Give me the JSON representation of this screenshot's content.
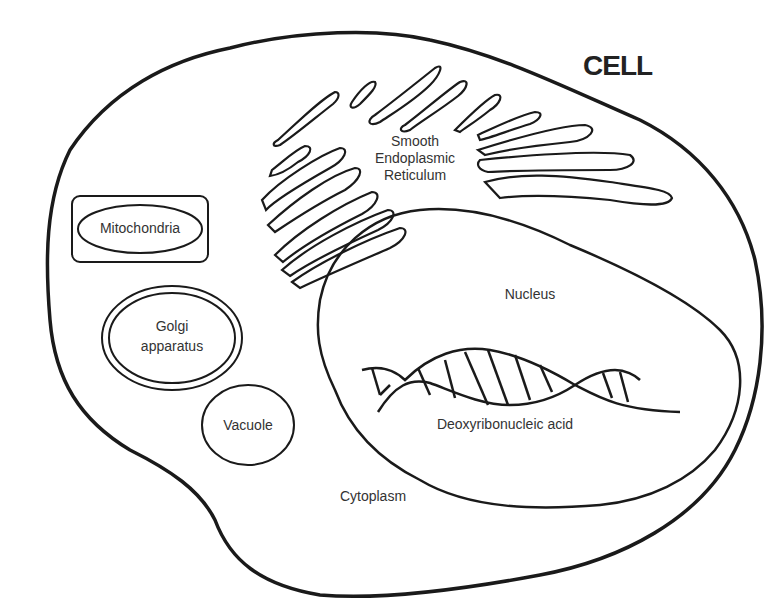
{
  "title": "CELL",
  "labels": {
    "smooth_er_line1": "Smooth",
    "smooth_er_line2": "Endoplasmic",
    "smooth_er_line3": "Reticulum",
    "mitochondria": "Mitochondria",
    "golgi_line1": "Golgi",
    "golgi_line2": "apparatus",
    "vacuole": "Vacuole",
    "nucleus": "Nucleus",
    "dna": "Deoxyribonucleic acid",
    "cytoplasm": "Cytoplasm"
  },
  "colors": {
    "stroke": "#1a1a1a",
    "text": "#333333",
    "background": "#ffffff"
  }
}
